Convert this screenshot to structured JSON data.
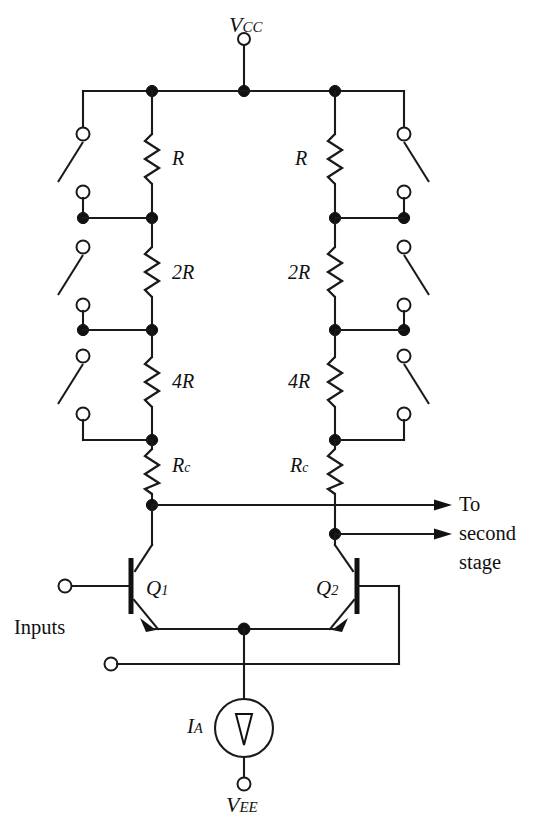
{
  "figure": {
    "name": "multiplying-dac-differential-pair-circuit",
    "type": "schematic"
  },
  "supplies": {
    "top_rail_label": "V",
    "top_rail_sub": "CC",
    "bottom_rail_label": "V",
    "bottom_rail_sub": "EE"
  },
  "resistors": {
    "left": [
      {
        "label": "R",
        "sub": ""
      },
      {
        "label": "2R",
        "sub": ""
      },
      {
        "label": "4R",
        "sub": ""
      },
      {
        "label": "R",
        "sub": "c"
      }
    ],
    "right": [
      {
        "label": "R",
        "sub": ""
      },
      {
        "label": "2R",
        "sub": ""
      },
      {
        "label": "4R",
        "sub": ""
      },
      {
        "label": "R",
        "sub": "c"
      }
    ]
  },
  "transistors": [
    {
      "label": "Q",
      "sub": "1",
      "name": "q1"
    },
    {
      "label": "Q",
      "sub": "2",
      "name": "q2"
    }
  ],
  "current_source": {
    "label": "I",
    "sub": "A",
    "direction": "down"
  },
  "annotations": {
    "inputs": "Inputs",
    "output_line1": "To",
    "output_line2": "second",
    "output_line3": "stage"
  },
  "colors": {
    "wire": "#1a1a1a",
    "node": "#111111",
    "background": "#ffffff",
    "terminal_fill": "#ffffff"
  },
  "switches": {
    "count_per_side": 3,
    "state": "open",
    "left_column_x": 83,
    "right_column_x": 404
  }
}
